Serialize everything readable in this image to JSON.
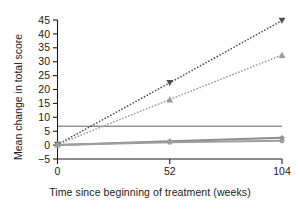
{
  "chart_data": {
    "type": "line",
    "title": "",
    "xlabel": "Time since beginning of treatment (weeks)",
    "ylabel": "Mean change in total score",
    "x": [
      0,
      52,
      104
    ],
    "xticks": [
      "0",
      "52",
      "104"
    ],
    "xtick_values": [
      0,
      52,
      104
    ],
    "xlim": [
      0,
      104
    ],
    "yticks": [
      "−5",
      "0",
      "5",
      "10",
      "15",
      "20",
      "25",
      "30",
      "35",
      "40",
      "45"
    ],
    "ytick_values": [
      -5,
      0,
      5,
      10,
      15,
      20,
      25,
      30,
      35,
      40,
      45
    ],
    "ylim": [
      -5,
      45
    ],
    "grid": false,
    "legend": "none",
    "series": [
      {
        "name": "series-1-down-triangle-dotted",
        "marker": "triangle-down",
        "linestyle": "dotted",
        "color": "#4d4d4d",
        "values": [
          0.2,
          22.4,
          44.8
        ]
      },
      {
        "name": "series-2-up-triangle-dotted",
        "marker": "triangle-up",
        "linestyle": "dotted",
        "color": "#9a9a9a",
        "values": [
          0.2,
          16.4,
          32.4
        ]
      },
      {
        "name": "series-3-diamond-solid",
        "marker": "diamond",
        "linestyle": "solid",
        "color": "#8c8c8c",
        "values": [
          0.0,
          1.4,
          2.6
        ]
      },
      {
        "name": "series-4-circle-solid",
        "marker": "circle",
        "linestyle": "solid",
        "color": "#9e9e9e",
        "values": [
          0.0,
          1.0,
          1.6
        ]
      }
    ]
  },
  "caption": {
    "clipped_text": ""
  }
}
